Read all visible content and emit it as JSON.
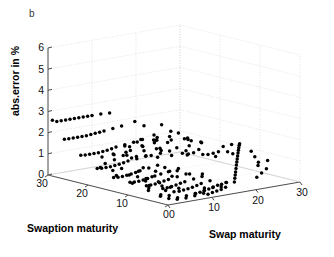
{
  "figure": {
    "panel_label": "b",
    "background": "#ffffff",
    "marker_color": "#000000",
    "axis_color": "#4d4d4d",
    "grid_color": "#d8d8d8"
  },
  "axes": {
    "y": {
      "title": "abs.error in %",
      "ticks": [
        0,
        1,
        2,
        3,
        4,
        5,
        6
      ],
      "tick_labels": [
        "0",
        "1",
        "2",
        "3",
        "4",
        "5",
        "6"
      ],
      "range": [
        0,
        6
      ]
    },
    "x_left": {
      "title": "Swaption maturity",
      "ticks": [
        0,
        10,
        20,
        30
      ],
      "tick_labels": [
        "0",
        "10",
        "20",
        "30"
      ],
      "range": [
        0,
        30
      ]
    },
    "x_right": {
      "title": "Swap maturity",
      "ticks": [
        0,
        10,
        20,
        30
      ],
      "tick_labels": [
        "0",
        "10",
        "20",
        "30"
      ],
      "range": [
        0,
        30
      ]
    }
  },
  "chart_data": {
    "type": "scatter",
    "title": "",
    "subtitle": "",
    "xlabel": "Swap maturity",
    "ylabel": "Swaption maturity",
    "zlabel": "abs.error in %",
    "xlim": [
      0,
      30
    ],
    "ylim": [
      0,
      30
    ],
    "zlim": [
      0,
      6
    ],
    "grid": true,
    "legend": "none",
    "projection": "3d",
    "annotations": [
      "b"
    ],
    "dimensions": [
      "swap_maturity",
      "swaption_maturity",
      "abs_error_pct"
    ],
    "points": [
      [
        1,
        30,
        2.55
      ],
      [
        2,
        30,
        2.45
      ],
      [
        3,
        30,
        2.45
      ],
      [
        4,
        30,
        2.45
      ],
      [
        5,
        30,
        2.45
      ],
      [
        6,
        30,
        2.45
      ],
      [
        7,
        30,
        2.45
      ],
      [
        8,
        30,
        2.45
      ],
      [
        9,
        30,
        2.45
      ],
      [
        10,
        30,
        2.45
      ],
      [
        12,
        30,
        2.45
      ],
      [
        14,
        30,
        2.42
      ],
      [
        1,
        27,
        1.8
      ],
      [
        2,
        27,
        1.78
      ],
      [
        3,
        27,
        1.78
      ],
      [
        4,
        27,
        1.78
      ],
      [
        5,
        27,
        1.78
      ],
      [
        6,
        27,
        1.78
      ],
      [
        7,
        27,
        1.8
      ],
      [
        8,
        27,
        1.82
      ],
      [
        9,
        27,
        1.84
      ],
      [
        10,
        27,
        1.86
      ],
      [
        12,
        27,
        1.9
      ],
      [
        14,
        27,
        1.95
      ],
      [
        17,
        27,
        2.05
      ],
      [
        20,
        28,
        1.7
      ],
      [
        24,
        28,
        1.6
      ],
      [
        2,
        24,
        1.15
      ],
      [
        3,
        24,
        1.12
      ],
      [
        4,
        24,
        1.12
      ],
      [
        5,
        24,
        1.12
      ],
      [
        6,
        24,
        1.12
      ],
      [
        7,
        24,
        1.14
      ],
      [
        8,
        24,
        1.16
      ],
      [
        9,
        24,
        1.2
      ],
      [
        10,
        24,
        1.24
      ],
      [
        12,
        24,
        1.28
      ],
      [
        14,
        24,
        1.32
      ],
      [
        16,
        24,
        1.38
      ],
      [
        3,
        21,
        0.62
      ],
      [
        4,
        21,
        0.6
      ],
      [
        5,
        21,
        0.6
      ],
      [
        6,
        21,
        0.6
      ],
      [
        7,
        21,
        0.62
      ],
      [
        8,
        21,
        0.64
      ],
      [
        9,
        21,
        0.68
      ],
      [
        10,
        21,
        0.72
      ],
      [
        12,
        21,
        0.76
      ],
      [
        14,
        21,
        0.8
      ],
      [
        4,
        18,
        0.3
      ],
      [
        5,
        18,
        0.28
      ],
      [
        6,
        18,
        0.28
      ],
      [
        7,
        18,
        0.3
      ],
      [
        8,
        18,
        0.32
      ],
      [
        9,
        18,
        0.36
      ],
      [
        10,
        18,
        0.4
      ],
      [
        12,
        18,
        0.46
      ],
      [
        14,
        18,
        0.52
      ],
      [
        5,
        15,
        0.18
      ],
      [
        6,
        15,
        0.16
      ],
      [
        7,
        15,
        0.16
      ],
      [
        8,
        15,
        0.18
      ],
      [
        9,
        15,
        0.22
      ],
      [
        10,
        15,
        0.26
      ],
      [
        12,
        15,
        0.32
      ],
      [
        14,
        15,
        0.38
      ],
      [
        16,
        15,
        0.44
      ],
      [
        6,
        12,
        0.12
      ],
      [
        7,
        12,
        0.12
      ],
      [
        8,
        12,
        0.14
      ],
      [
        9,
        12,
        0.16
      ],
      [
        10,
        12,
        0.2
      ],
      [
        11,
        12,
        0.24
      ],
      [
        13,
        12,
        0.3
      ],
      [
        15,
        12,
        0.36
      ],
      [
        7,
        9,
        0.1
      ],
      [
        8,
        9,
        0.1
      ],
      [
        9,
        9,
        0.12
      ],
      [
        10,
        9,
        0.16
      ],
      [
        11,
        9,
        0.2
      ],
      [
        12,
        9,
        0.24
      ],
      [
        14,
        9,
        0.3
      ],
      [
        8,
        6,
        0.08
      ],
      [
        9,
        6,
        0.1
      ],
      [
        10,
        6,
        0.12
      ],
      [
        11,
        6,
        0.16
      ],
      [
        12,
        6,
        0.2
      ],
      [
        13,
        6,
        0.26
      ],
      [
        15,
        6,
        0.32
      ],
      [
        9,
        3,
        0.08
      ],
      [
        10,
        3,
        0.1
      ],
      [
        11,
        3,
        0.14
      ],
      [
        12,
        3,
        0.18
      ],
      [
        13,
        3,
        0.24
      ],
      [
        14,
        3,
        0.28
      ],
      [
        16,
        3,
        0.34
      ],
      [
        10,
        1,
        0.1
      ],
      [
        11,
        1,
        0.14
      ],
      [
        12,
        1,
        0.18
      ],
      [
        13,
        1,
        0.22
      ],
      [
        14,
        1,
        0.28
      ],
      [
        2,
        13,
        2.1
      ],
      [
        3,
        11,
        2.35
      ],
      [
        4,
        14,
        1.95
      ],
      [
        5,
        9,
        2.7
      ],
      [
        6,
        16,
        1.6
      ],
      [
        7,
        7,
        2.9
      ],
      [
        8,
        12,
        2.2
      ],
      [
        9,
        5,
        2.6
      ],
      [
        10,
        17,
        1.4
      ],
      [
        11,
        8,
        2.35
      ],
      [
        3,
        6,
        2.8
      ],
      [
        5,
        19,
        1.3
      ],
      [
        6,
        4,
        3.0
      ],
      [
        8,
        20,
        1.1
      ],
      [
        9,
        10,
        2.15
      ],
      [
        4,
        8,
        2.55
      ],
      [
        7,
        14,
        1.85
      ],
      [
        10,
        6,
        2.45
      ],
      [
        12,
        11,
        1.75
      ],
      [
        13,
        16,
        1.35
      ],
      [
        2,
        9,
        2.6
      ],
      [
        5,
        12,
        2.05
      ],
      [
        7,
        18,
        1.25
      ],
      [
        11,
        15,
        1.55
      ],
      [
        14,
        7,
        2.1
      ],
      [
        3,
        17,
        1.5
      ],
      [
        6,
        10,
        2.25
      ],
      [
        9,
        19,
        1.0
      ],
      [
        12,
        5,
        2.3
      ],
      [
        15,
        12,
        1.45
      ],
      [
        4,
        4,
        2.9
      ],
      [
        8,
        8,
        2.4
      ],
      [
        11,
        20,
        0.95
      ],
      [
        13,
        9,
        1.9
      ],
      [
        16,
        14,
        1.2
      ],
      [
        2,
        5,
        2.75
      ],
      [
        5,
        16,
        1.55
      ],
      [
        8,
        3,
        2.6
      ],
      [
        10,
        13,
        1.7
      ],
      [
        14,
        18,
        0.9
      ],
      [
        17,
        10,
        1.3
      ],
      [
        18,
        15,
        1.0
      ],
      [
        19,
        6,
        1.55
      ],
      [
        20,
        12,
        1.1
      ],
      [
        21,
        18,
        0.8
      ],
      [
        16,
        5,
        1.7
      ],
      [
        19,
        20,
        0.7
      ],
      [
        22,
        8,
        1.25
      ],
      [
        23,
        14,
        0.95
      ],
      [
        24,
        20,
        0.65
      ],
      [
        15,
        22,
        0.75
      ],
      [
        18,
        24,
        0.55
      ],
      [
        21,
        25,
        0.5
      ],
      [
        24,
        26,
        0.45
      ],
      [
        27,
        22,
        0.6
      ],
      [
        17,
        2,
        0.55
      ],
      [
        18,
        3,
        0.62
      ],
      [
        19,
        4,
        0.68
      ],
      [
        20,
        5,
        0.76
      ],
      [
        21,
        6,
        0.84
      ],
      [
        22,
        7,
        0.9
      ],
      [
        23,
        8,
        0.96
      ],
      [
        24,
        9,
        1.02
      ],
      [
        25,
        10,
        1.08
      ],
      [
        26,
        11,
        1.12
      ],
      [
        27,
        12,
        1.16
      ],
      [
        28,
        13,
        1.2
      ],
      [
        29,
        14,
        1.18
      ],
      [
        29,
        16,
        1.05
      ],
      [
        16,
        1,
        0.46
      ],
      [
        15,
        2,
        0.42
      ],
      [
        14,
        2,
        0.38
      ],
      [
        13,
        1,
        0.34
      ],
      [
        12,
        2,
        0.3
      ],
      [
        25,
        5,
        0.72
      ],
      [
        26,
        6,
        0.8
      ],
      [
        27,
        8,
        0.92
      ],
      [
        28,
        10,
        1.05
      ],
      [
        28,
        17,
        0.95
      ],
      [
        22,
        2,
        0.42
      ],
      [
        24,
        3,
        0.5
      ],
      [
        26,
        4,
        0.58
      ],
      [
        29,
        7,
        0.72
      ],
      [
        29,
        20,
        0.3
      ],
      [
        11,
        3,
        0.26
      ],
      [
        10,
        2,
        0.22
      ],
      [
        9,
        1,
        0.18
      ],
      [
        8,
        2,
        0.16
      ],
      [
        7,
        1,
        0.14
      ],
      [
        6,
        2,
        0.12
      ],
      [
        5,
        1,
        0.1
      ],
      [
        4,
        2,
        0.1
      ],
      [
        3,
        1,
        0.12
      ],
      [
        2,
        2,
        0.14
      ],
      [
        3,
        3,
        0.2
      ],
      [
        4,
        5,
        0.3
      ],
      [
        5,
        4,
        0.26
      ],
      [
        6,
        6,
        0.34
      ],
      [
        7,
        5,
        0.3
      ],
      [
        2,
        4,
        0.22
      ],
      [
        3,
        8,
        0.44
      ],
      [
        4,
        10,
        0.52
      ],
      [
        5,
        7,
        0.38
      ],
      [
        6,
        9,
        0.46
      ],
      [
        2,
        7,
        0.4
      ],
      [
        3,
        13,
        0.7
      ],
      [
        4,
        12,
        0.62
      ],
      [
        5,
        11,
        0.55
      ],
      [
        6,
        14,
        0.72
      ],
      [
        1,
        3,
        0.24
      ],
      [
        1,
        6,
        0.36
      ],
      [
        1,
        10,
        0.52
      ],
      [
        1,
        14,
        0.7
      ],
      [
        1,
        18,
        0.88
      ],
      [
        2,
        16,
        0.8
      ],
      [
        3,
        19,
        0.95
      ],
      [
        4,
        16,
        0.82
      ],
      [
        5,
        22,
        1.05
      ],
      [
        6,
        20,
        0.98
      ],
      [
        7,
        11,
        0.6
      ],
      [
        8,
        15,
        0.76
      ],
      [
        9,
        13,
        0.66
      ],
      [
        10,
        10,
        0.52
      ],
      [
        11,
        12,
        0.6
      ],
      [
        12,
        14,
        0.68
      ],
      [
        13,
        12,
        0.58
      ],
      [
        14,
        10,
        0.48
      ],
      [
        15,
        8,
        0.42
      ],
      [
        16,
        9,
        0.46
      ]
    ]
  }
}
